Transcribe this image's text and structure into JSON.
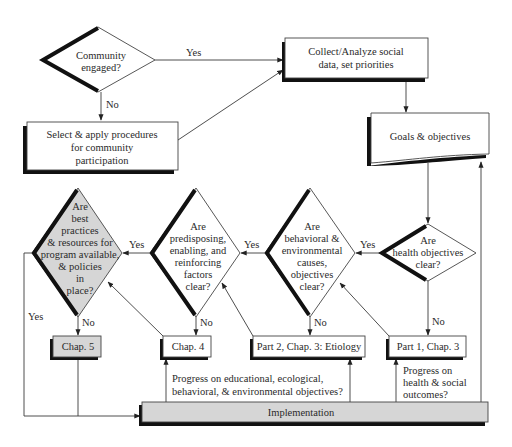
{
  "diagram": {
    "type": "flowchart",
    "nodes": {
      "community_engaged": {
        "kind": "decision",
        "lines": [
          "Community",
          "engaged?"
        ]
      },
      "select_apply": {
        "kind": "process",
        "lines": [
          "Select & apply procedures",
          "for community",
          "participation"
        ]
      },
      "collect_analyze": {
        "kind": "process",
        "lines": [
          "Collect/Analyze social",
          "data, set priorities"
        ]
      },
      "goals_objectives": {
        "kind": "document",
        "lines": [
          "Goals & objectives"
        ]
      },
      "health_objectives": {
        "kind": "decision",
        "lines": [
          "Are",
          "health objectives",
          "clear?"
        ]
      },
      "behavioral_env": {
        "kind": "decision",
        "lines": [
          "Are",
          "behavioral &",
          "environmental",
          "causes,",
          "objectives",
          "clear?"
        ]
      },
      "predisposing": {
        "kind": "decision",
        "lines": [
          "Are",
          "predisposing,",
          "enabling, and",
          "reinforcing",
          "factors",
          "clear?"
        ]
      },
      "best_practices": {
        "kind": "decision",
        "shaded": true,
        "lines": [
          "Are",
          "best",
          "practices",
          "& resources for",
          "program available,",
          "& policies",
          "in",
          "place?"
        ]
      },
      "chap5": {
        "kind": "process",
        "shaded": true,
        "lines": [
          "Chap. 5"
        ]
      },
      "chap4": {
        "kind": "process",
        "lines": [
          "Chap. 4"
        ]
      },
      "part2_chap3": {
        "kind": "process",
        "lines": [
          "Part 2, Chap. 3: Etiology"
        ]
      },
      "part1_chap3": {
        "kind": "process",
        "lines": [
          "Part 1, Chap. 3"
        ]
      },
      "implementation": {
        "kind": "process",
        "shaded": true,
        "lines": [
          "Implementation"
        ]
      }
    },
    "edge_labels": {
      "yes": "Yes",
      "no": "No"
    },
    "annotations": {
      "progress_educational": [
        "Progress on educational, ecological,",
        "behavioral, & environmental objectives?"
      ],
      "progress_health": [
        "Progress on",
        "health & social",
        "outcomes?"
      ]
    },
    "edges": [
      {
        "from": "community_engaged",
        "to": "collect_analyze",
        "label": "Yes"
      },
      {
        "from": "community_engaged",
        "to": "select_apply",
        "label": "No"
      },
      {
        "from": "select_apply",
        "to": "collect_analyze",
        "label": ""
      },
      {
        "from": "collect_analyze",
        "to": "goals_objectives",
        "label": ""
      },
      {
        "from": "goals_objectives",
        "to": "health_objectives",
        "label": ""
      },
      {
        "from": "health_objectives",
        "to": "behavioral_env",
        "label": "Yes"
      },
      {
        "from": "health_objectives",
        "to": "part1_chap3",
        "label": "No"
      },
      {
        "from": "behavioral_env",
        "to": "predisposing",
        "label": "Yes"
      },
      {
        "from": "behavioral_env",
        "to": "part2_chap3",
        "label": "No"
      },
      {
        "from": "predisposing",
        "to": "best_practices",
        "label": "Yes"
      },
      {
        "from": "predisposing",
        "to": "chap4",
        "label": "No"
      },
      {
        "from": "best_practices",
        "to": "implementation",
        "label": "Yes"
      },
      {
        "from": "best_practices",
        "to": "chap5",
        "label": "No"
      },
      {
        "from": "chap5",
        "to": "implementation",
        "label": ""
      },
      {
        "from": "chap4",
        "to": "best_practices",
        "label": ""
      },
      {
        "from": "part2_chap3",
        "to": "predisposing",
        "label": ""
      },
      {
        "from": "part1_chap3",
        "to": "behavioral_env",
        "label": ""
      },
      {
        "from": "implementation",
        "to": "chap4",
        "label": ""
      },
      {
        "from": "implementation",
        "to": "part2_chap3",
        "label": ""
      },
      {
        "from": "implementation",
        "to": "part1_chap3",
        "label": ""
      },
      {
        "from": "implementation",
        "to": "goals_objectives",
        "label": ""
      }
    ]
  }
}
